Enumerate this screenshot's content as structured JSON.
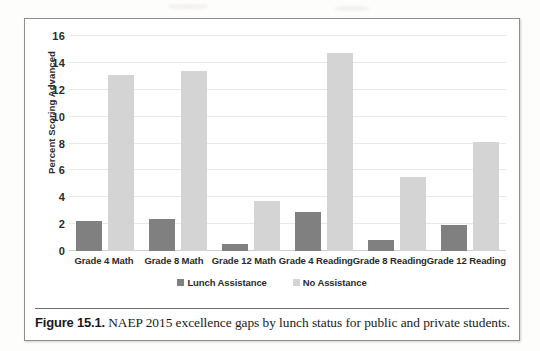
{
  "figure": {
    "caption_label": "Figure 15.1.",
    "caption_text": " NAEP 2015 excellence gaps by lunch status for public and private students."
  },
  "colors": {
    "series_lunch_assistance": "#808080",
    "series_no_assistance": "#d4d4d4",
    "gridline": "#e9e9e9",
    "axis_text": "#2b2b2b",
    "frame": "#8d8d8d"
  },
  "chart_data": {
    "type": "bar",
    "title": "",
    "xlabel": "",
    "ylabel": "Percent Scoring Advanced",
    "ylim": [
      0,
      16
    ],
    "yticks": [
      0,
      2,
      4,
      6,
      8,
      10,
      12,
      14,
      16
    ],
    "ytick_labels": [
      "0",
      "2",
      "4",
      "6",
      "8",
      "10",
      "12",
      "14",
      "16"
    ],
    "grid": true,
    "legend_position": "bottom-center",
    "categories": [
      "Grade 4 Math",
      "Grade 8 Math",
      "Grade 12 Math",
      "Grade 4 Reading",
      "Grade 8 Reading",
      "Grade 12 Reading"
    ],
    "series": [
      {
        "name": "Lunch Assistance",
        "color": "#808080",
        "values": [
          2.2,
          2.4,
          0.5,
          2.9,
          0.8,
          1.9
        ]
      },
      {
        "name": "No Assistance",
        "color": "#d4d4d4",
        "values": [
          13.1,
          13.4,
          3.7,
          14.7,
          5.5,
          8.1
        ]
      }
    ]
  }
}
